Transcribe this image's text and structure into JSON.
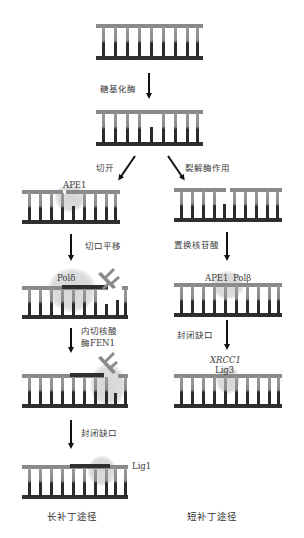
{
  "diagram": {
    "steps": {
      "glycosylase": "糖基化酶",
      "incision": "切开",
      "lyase": "裂解酶作用",
      "nick_translation": "切口平移",
      "nucleotide_replacement": "置换核苷酸",
      "endonuclease_line1": "内切核酸",
      "endonuclease_line2": "酶FEN1",
      "seal_nick_long": "封闭缺口",
      "seal_nick_short": "封闭缺口"
    },
    "enzymes": {
      "ape1_left": "APE1",
      "pol_delta": "Polδ",
      "ape1_right": "APE1",
      "pol_beta": "Polβ",
      "xrcc1": "XRCC1",
      "lig3": "Lig3",
      "lig1": "Lig1"
    },
    "pathways": {
      "long_patch": "长补丁途径",
      "short_patch": "短补丁途径"
    },
    "colors": {
      "top_strand": "#8a8a8a",
      "bottom_strand": "#333333",
      "enzyme_blob": "#d8d8d8"
    }
  }
}
